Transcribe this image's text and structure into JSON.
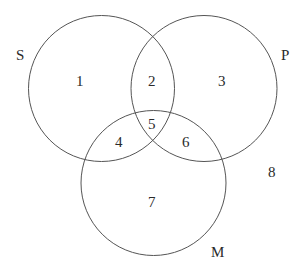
{
  "diagram": {
    "type": "venn-3-set",
    "sets": [
      {
        "name": "S",
        "label": "S"
      },
      {
        "name": "P",
        "label": "P"
      },
      {
        "name": "M",
        "label": "M"
      }
    ],
    "regions": {
      "r1": "1",
      "r2": "2",
      "r3": "3",
      "r4": "4",
      "r5": "5",
      "r6": "6",
      "r7": "7",
      "r8": "8"
    },
    "colors": {
      "stroke": "#555555",
      "text": "#2a2a2a",
      "background": "#ffffff"
    }
  }
}
